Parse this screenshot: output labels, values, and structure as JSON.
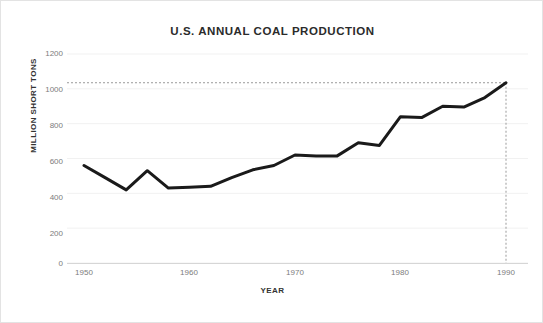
{
  "chart_data": {
    "type": "line",
    "title": "U.S. ANNUAL COAL PRODUCTION",
    "xlabel": "YEAR",
    "ylabel": "MILLION SHORT TONS",
    "xlim": [
      1949,
      1991
    ],
    "ylim": [
      0,
      1200
    ],
    "yticks": [
      0,
      200,
      400,
      600,
      800,
      1000,
      1200
    ],
    "ytick_labels": [
      "0",
      "200",
      "400",
      "600",
      "800",
      "1000",
      "1200"
    ],
    "xticks": [
      1950,
      1960,
      1970,
      1980,
      1990
    ],
    "xtick_labels": [
      "1950",
      "1960",
      "1970",
      "1980",
      "1990"
    ],
    "grid": "horizontal-faint",
    "legend": null,
    "series": [
      {
        "name": "U.S. annual coal production",
        "color": "#1a1a1a",
        "line_width": 3,
        "x": [
          1950,
          1952,
          1954,
          1956,
          1958,
          1960,
          1962,
          1964,
          1966,
          1968,
          1970,
          1972,
          1974,
          1976,
          1978,
          1980,
          1982,
          1984,
          1986,
          1988,
          1990
        ],
        "values": [
          560,
          490,
          420,
          530,
          430,
          435,
          440,
          490,
          535,
          560,
          620,
          615,
          615,
          690,
          675,
          840,
          835,
          900,
          895,
          950,
          1035
        ]
      }
    ],
    "annotations": [
      {
        "name": "reference-line-horizontal",
        "type": "dashed-horizontal",
        "y": 1035,
        "color": "#9a9a9a"
      },
      {
        "name": "reference-line-vertical",
        "type": "dashed-vertical",
        "x": 1990,
        "y_from": 0,
        "y_to": 1035,
        "color": "#9a9a9a"
      }
    ]
  }
}
